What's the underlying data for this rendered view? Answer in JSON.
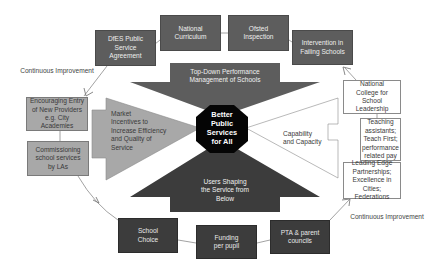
{
  "diagram": {
    "center": {
      "label": "Better Public Services for All",
      "lines": [
        "Better",
        "Public",
        "Services",
        "for All"
      ]
    },
    "arrows": {
      "top": {
        "label": "Top-Down Performance Management of Schools",
        "lines": [
          "Top-Down Performance",
          "Management of Schools"
        ],
        "color": "#5d5d5d"
      },
      "left": {
        "label": "Market Incentives to Increase Efficiency and Quality of Service",
        "lines": [
          "Market",
          "Incentives to",
          "Increase Efficiency",
          "and Quality of",
          "Service"
        ],
        "color": "#a8a8a8"
      },
      "right": {
        "label": "Capability and Capacity",
        "lines": [
          "Capability",
          "and Capacity"
        ],
        "color": "#ffffff"
      },
      "bottom": {
        "label": "Users Shaping the Service from Below",
        "lines": [
          "Users Shaping",
          "the Service from",
          "Below"
        ],
        "color": "#3c3c3c"
      }
    },
    "top_boxes": [
      {
        "label": "DfES Public Service Agreement"
      },
      {
        "label": "National Curriculum"
      },
      {
        "label": "Ofsted Inspection"
      },
      {
        "label": "Intervention in Failing Schools"
      }
    ],
    "left_boxes": [
      {
        "label": "Encouraging Entry of New Providers e.g. City Academies"
      },
      {
        "label": "Commissioning school services by LAs"
      }
    ],
    "right_boxes": [
      {
        "label": "National College for School Leadership"
      },
      {
        "label": "Teaching assistants; Teach First; performance related pay"
      },
      {
        "label": "Leading Edge Partnerships; Excellence in Cities; Federations"
      }
    ],
    "bottom_boxes": [
      {
        "label": "School Choice"
      },
      {
        "label": "Funding per pupil"
      },
      {
        "label": "PTA & parent councils"
      }
    ],
    "cycle_labels": {
      "top_left": "Continuous Improvement",
      "bottom_right": "Continuous Improvement"
    }
  }
}
